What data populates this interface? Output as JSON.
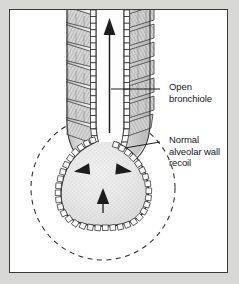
{
  "figure": {
    "frame": {
      "border_color": "#3a3a3a",
      "background_color": "#ffffff",
      "outer_background_color": "#d8d8d6"
    },
    "ink_color": "#1b1b1b",
    "tissue_fill_color": "#e9e9e9",
    "muscle_fill_color": "#cfcfcf"
  },
  "labels": [
    {
      "id": "open-bronchiole",
      "lines": [
        "Open",
        "bronchiole"
      ],
      "line1": "Open",
      "line2": "bronchiole",
      "points_to": "bronchiole-wall"
    },
    {
      "id": "normal-alveolar-wall-recoil",
      "lines": [
        "Normal",
        "alveolar wall",
        "recoil"
      ],
      "line1": "Normal",
      "line2": "alveolar wall",
      "line3": "recoil",
      "points_to": "alveolar-wall"
    }
  ],
  "structures": {
    "bronchiole": {
      "name": "Open bronchiole",
      "state": "open",
      "lumen_airflow_direction": "upward",
      "smooth_muscle_bands": 7,
      "epithelium": "columnar cell lining"
    },
    "alveolus": {
      "name": "Alveolar sac",
      "recoil_arrows": 3,
      "recoil_arrow_directions": [
        "left-inward",
        "right-inward",
        "upward-inward"
      ],
      "epithelium": "cuboidal cell lining"
    },
    "distended_outline": {
      "name": "Distended alveolar outline",
      "style": "dashed circle"
    }
  },
  "arrows": {
    "airflow": {
      "name": "airflow-arrow",
      "direction": "up",
      "meaning": "air flowing out of bronchiole"
    },
    "recoil_left": {
      "name": "recoil-arrow-left",
      "direction": "left"
    },
    "recoil_right": {
      "name": "recoil-arrow-right",
      "direction": "right"
    },
    "recoil_bottom": {
      "name": "recoil-arrow-bottom",
      "direction": "up"
    }
  }
}
